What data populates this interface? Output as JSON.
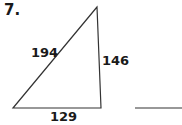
{
  "problem": {
    "number": "7.",
    "shape": "triangle",
    "sides": {
      "hypotenuse": "194",
      "vertical": "146",
      "base": "129"
    },
    "answer": ""
  }
}
